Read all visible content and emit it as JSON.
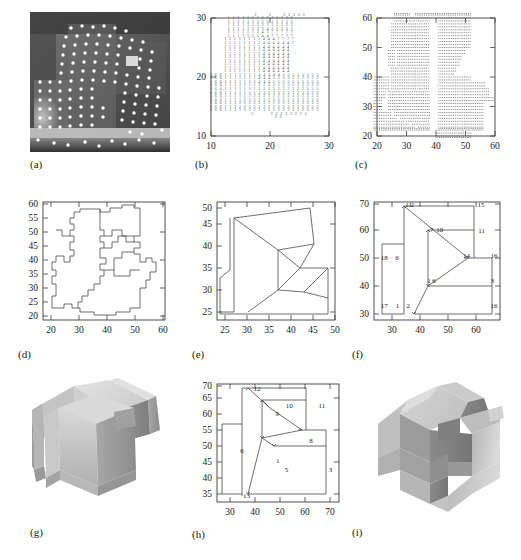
{
  "figure": {
    "panels": [
      {
        "id": "a",
        "caption": "(a)",
        "type": "photo",
        "description": "grayscale range image with detected feature points"
      },
      {
        "id": "b",
        "caption": "(b)",
        "type": "digit-map",
        "description": "surface-type label map"
      },
      {
        "id": "c",
        "caption": "(c)",
        "type": "stipple",
        "description": "dot-sampled region map"
      },
      {
        "id": "d",
        "caption": "(d)",
        "type": "polygon",
        "description": "raw region boundaries"
      },
      {
        "id": "e",
        "caption": "(e)",
        "type": "polygon",
        "description": "simplified polygonal boundaries"
      },
      {
        "id": "f",
        "caption": "(f)",
        "type": "labeled-polygon",
        "description": "labeled face adjacency graph"
      },
      {
        "id": "g",
        "caption": "(g)",
        "type": "render3d",
        "description": "shaded 3D reconstruction view 1"
      },
      {
        "id": "h",
        "caption": "(h)",
        "type": "labeled-polygon",
        "description": "labeled face adjacency graph second view"
      },
      {
        "id": "i",
        "caption": "(i)",
        "type": "render3d",
        "description": "shaded 3D reconstruction view 2"
      }
    ]
  },
  "chart_data": [
    {
      "panel": "b",
      "type": "heatmap",
      "title": "",
      "xlabel": "",
      "ylabel": "",
      "xlim": [
        8,
        31
      ],
      "ylim": [
        8,
        31
      ],
      "xticks": [
        10,
        20,
        30
      ],
      "yticks": [
        10,
        20,
        30
      ],
      "grid": false,
      "legend": "none",
      "value_labels": [
        "1",
        "2",
        "3",
        "4",
        "5",
        "6",
        "7"
      ],
      "note": "each grid cell prints an integer surface-type code",
      "rows": [
        {
          "y": 30.4,
          "x0": 17.5,
          "codes": "3  3  33333"
        },
        {
          "y": 29.8,
          "x0": 13.0,
          "codes": "11333333333333"
        },
        {
          "y": 29.2,
          "x0": 13.0,
          "codes": "11333333333333"
        },
        {
          "y": 28.6,
          "x0": 13.0,
          "codes": "11113333333333"
        },
        {
          "y": 28.0,
          "x0": 13.0,
          "codes": "11111333433333"
        },
        {
          "y": 27.4,
          "x0": 13.0,
          "codes": "11111134377777"
        },
        {
          "y": 26.8,
          "x0": 13.0,
          "codes": "11111114477777"
        },
        {
          "y": 26.2,
          "x0": 12.4,
          "codes": "111111114447777"
        },
        {
          "y": 25.6,
          "x0": 12.4,
          "codes": "111111114444447"
        },
        {
          "y": 25.0,
          "x0": 12.4,
          "codes": "11111111444444"
        },
        {
          "y": 24.4,
          "x0": 12.4,
          "codes": "11111111444444"
        },
        {
          "y": 23.8,
          "x0": 12.4,
          "codes": "11111111444444"
        },
        {
          "y": 23.2,
          "x0": 12.4,
          "codes": "11111111444444"
        },
        {
          "y": 22.6,
          "x0": 12.4,
          "codes": "11111111444444"
        },
        {
          "y": 22.0,
          "x0": 12.4,
          "codes": "11111111444444"
        },
        {
          "y": 21.4,
          "x0": 12.4,
          "codes": "11111111444444"
        },
        {
          "y": 20.8,
          "x0": 12.4,
          "codes": "11111111444444"
        },
        {
          "y": 20.2,
          "x0": 10.0,
          "codes": "66611111114444455555555"
        },
        {
          "y": 19.6,
          "x0": 10.0,
          "codes": "66611111114445552222222"
        },
        {
          "y": 19.0,
          "x0": 10.0,
          "codes": "66611111114445555555555"
        },
        {
          "y": 18.4,
          "x0": 10.0,
          "codes": "66611111112255555222222"
        },
        {
          "y": 17.8,
          "x0": 10.0,
          "codes": "66611111112255222222555"
        },
        {
          "y": 17.2,
          "x0": 10.0,
          "codes": "66611111112222222222222"
        },
        {
          "y": 16.6,
          "x0": 10.0,
          "codes": "66611111222222222222222"
        },
        {
          "y": 16.0,
          "x0": 10.0,
          "codes": "66611112222222222222222"
        },
        {
          "y": 15.4,
          "x0": 10.0,
          "codes": "66611122222222222222222"
        },
        {
          "y": 14.8,
          "x0": 10.0,
          "codes": "66611222222222222222222"
        },
        {
          "y": 14.2,
          "x0": 10.0,
          "codes": "66612222222222222222222"
        },
        {
          "y": 13.6,
          "x0": 17.0,
          "codes": "2   22222222"
        },
        {
          "y": 13.0,
          "x0": 21.0,
          "codes": "22"
        }
      ]
    },
    {
      "panel": "c",
      "type": "scatter",
      "title": "",
      "xlabel": "",
      "ylabel": "",
      "xlim": [
        18,
        62
      ],
      "ylim": [
        18,
        63
      ],
      "xticks": [
        20,
        30,
        40,
        50,
        60
      ],
      "yticks": [
        20,
        30,
        40,
        50,
        60
      ],
      "grid": false,
      "legend": "none",
      "note": "binary occupancy of a 1-unit sampling lattice"
    },
    {
      "panel": "d",
      "type": "line",
      "title": "",
      "xlabel": "",
      "ylabel": "",
      "xlim": [
        17,
        62
      ],
      "ylim": [
        19,
        62
      ],
      "xticks": [
        20,
        30,
        40,
        50,
        60
      ],
      "yticks": [
        20,
        25,
        30,
        35,
        40,
        45,
        50,
        55,
        60
      ],
      "grid": false,
      "legend": "none"
    },
    {
      "panel": "e",
      "type": "line",
      "title": "",
      "xlabel": "",
      "ylabel": "",
      "xlim": [
        22,
        51
      ],
      "ylim": [
        23,
        52
      ],
      "xticks": [
        25,
        30,
        35,
        40,
        45,
        50
      ],
      "yticks": [
        25,
        30,
        35,
        40,
        45,
        50
      ],
      "grid": false,
      "legend": "none"
    },
    {
      "panel": "f",
      "type": "line",
      "title": "",
      "xlabel": "",
      "ylabel": "",
      "xlim": [
        27,
        72
      ],
      "ylim": [
        29,
        71
      ],
      "xticks": [
        30,
        40,
        50,
        60
      ],
      "yticks": [
        30,
        40,
        50,
        60,
        70
      ],
      "grid": false,
      "legend": "none",
      "vertex_labels": [
        "11",
        "2",
        "15",
        "7",
        "10",
        "11",
        "18",
        "6",
        "16",
        "14",
        "6",
        "3",
        "17",
        "1",
        "2",
        "16"
      ]
    },
    {
      "panel": "h",
      "type": "line",
      "title": "",
      "xlabel": "",
      "ylabel": "",
      "xlim": [
        27,
        72
      ],
      "ylim": [
        32,
        71
      ],
      "xticks": [
        30,
        40,
        50,
        60,
        70
      ],
      "yticks": [
        35,
        40,
        45,
        50,
        55,
        60,
        65,
        70
      ],
      "grid": false,
      "legend": "none",
      "vertex_labels": [
        "12",
        "10",
        "11",
        "9",
        "8",
        "6",
        "1",
        "5",
        "3",
        "13",
        "2"
      ]
    }
  ],
  "panel_a": {
    "caption": "(a)"
  },
  "panel_b": {
    "caption": "(b)",
    "xticks": [
      "10",
      "20",
      "30"
    ],
    "yticks": [
      "10",
      "20",
      "30"
    ]
  },
  "panel_c": {
    "caption": "(c)",
    "xticks": [
      "20",
      "30",
      "40",
      "50",
      "60"
    ],
    "yticks": [
      "20",
      "30",
      "40",
      "50",
      "60"
    ]
  },
  "panel_d": {
    "caption": "(d)",
    "xticks": [
      "20",
      "30",
      "40",
      "50",
      "60"
    ],
    "yticks": [
      "20",
      "25",
      "30",
      "35",
      "40",
      "45",
      "50",
      "55",
      "60"
    ]
  },
  "panel_e": {
    "caption": "(e)",
    "xticks": [
      "25",
      "30",
      "35",
      "40",
      "45",
      "50"
    ],
    "yticks": [
      "25",
      "30",
      "35",
      "40",
      "45",
      "50"
    ]
  },
  "panel_f": {
    "caption": "(f)",
    "xticks": [
      "30",
      "40",
      "50",
      "60"
    ],
    "yticks": [
      "30",
      "40",
      "50",
      "60",
      "70"
    ],
    "labels": [
      {
        "t": "11",
        "x": 38.2,
        "y": 69.4
      },
      {
        "t": "2",
        "x": 40.0,
        "y": 69.4
      },
      {
        "t": "15",
        "x": 64.0,
        "y": 69.2
      },
      {
        "t": "7",
        "x": 47.0,
        "y": 60.3
      },
      {
        "t": "10",
        "x": 49.2,
        "y": 60.3
      },
      {
        "t": "11",
        "x": 64.2,
        "y": 60.0
      },
      {
        "t": "18",
        "x": 29.4,
        "y": 50.3
      },
      {
        "t": "6",
        "x": 34.6,
        "y": 50.3
      },
      {
        "t": "16",
        "x": 68.6,
        "y": 51.0
      },
      {
        "t": "14",
        "x": 58.8,
        "y": 51.0
      },
      {
        "t": "6",
        "x": 47.8,
        "y": 42.2
      },
      {
        "t": "1",
        "x": 46.0,
        "y": 42.2
      },
      {
        "t": "3",
        "x": 68.6,
        "y": 42.0
      },
      {
        "t": "17",
        "x": 29.4,
        "y": 33.4
      },
      {
        "t": "1",
        "x": 34.8,
        "y": 33.4
      },
      {
        "t": "2",
        "x": 38.6,
        "y": 33.2
      },
      {
        "t": "16",
        "x": 68.6,
        "y": 33.4
      }
    ]
  },
  "panel_g": {
    "caption": "(g)"
  },
  "panel_h": {
    "caption": "(h)",
    "xticks": [
      "30",
      "40",
      "50",
      "60",
      "70"
    ],
    "yticks": [
      "35",
      "40",
      "45",
      "50",
      "55",
      "60",
      "65",
      "70"
    ],
    "labels": [
      {
        "t": "12",
        "x": 40.6,
        "y": 68.8
      },
      {
        "t": "10",
        "x": 52.4,
        "y": 63.2
      },
      {
        "t": "11",
        "x": 64.4,
        "y": 63.0
      },
      {
        "t": "9",
        "x": 48.6,
        "y": 60.4
      },
      {
        "t": "8",
        "x": 61.0,
        "y": 51.6
      },
      {
        "t": "6",
        "x": 35.6,
        "y": 48.2
      },
      {
        "t": "1",
        "x": 48.8,
        "y": 45.0
      },
      {
        "t": "5",
        "x": 52.0,
        "y": 41.8
      },
      {
        "t": "3",
        "x": 68.2,
        "y": 41.8
      },
      {
        "t": "13",
        "x": 36.6,
        "y": 33.2
      }
    ]
  },
  "panel_i": {
    "caption": "(i)"
  },
  "colors": {
    "axis": "#3c3c3c",
    "line": "#4a4a4a",
    "digit": "#555555",
    "dot": "#6e6e6e",
    "text": "#1a1a1a",
    "render_light": "#d8d8d8",
    "render_mid": "#b4b4b4",
    "render_dark": "#8f8f8f",
    "render_darker": "#6f6f6f"
  }
}
